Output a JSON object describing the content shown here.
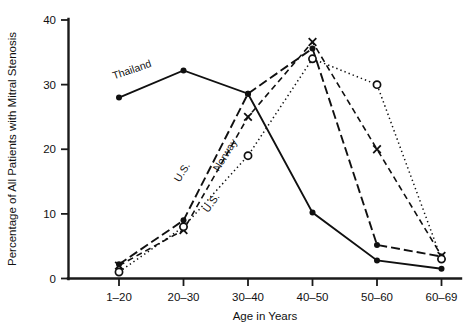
{
  "chart_data": {
    "type": "line",
    "title": "",
    "xlabel": "Age in Years",
    "ylabel": "Percentage of All Patients with Mitral Stenosis",
    "categories": [
      "1–20",
      "20–30",
      "30–40",
      "40–50",
      "50–60",
      "60–69"
    ],
    "ylim": [
      0,
      40
    ],
    "yticks": [
      0,
      10,
      20,
      30,
      40
    ],
    "ytick_labels": [
      "0",
      "10",
      "20",
      "30",
      "40"
    ],
    "grid": false,
    "legend": "inline-labels",
    "series": [
      {
        "name": "Thailand",
        "marker": "filled-circle",
        "line_style": "solid",
        "values": [
          28,
          32.2,
          28.6,
          10.2,
          2.8,
          1.5
        ],
        "label_text": "Thailand"
      },
      {
        "name": "U.S. (dash-dot)",
        "marker": "filled-circle",
        "line_style": "dash-dot",
        "values": [
          2.2,
          9,
          28.6,
          35.6,
          5.2,
          3.4
        ],
        "label_text": "U.S."
      },
      {
        "name": "Norway",
        "marker": "x",
        "line_style": "dashed",
        "values": [
          2,
          7.5,
          25,
          36.6,
          20,
          3.5
        ],
        "label_text": "Norway"
      },
      {
        "name": "U.S. (dotted)",
        "marker": "open-circle",
        "line_style": "dotted",
        "values": [
          1,
          8,
          19,
          34,
          30,
          3
        ],
        "label_text": "U.S."
      }
    ],
    "annotations": [
      {
        "text": "Thailand",
        "series": "Thailand"
      },
      {
        "text": "U.S.",
        "series": "U.S. (dash-dot)"
      },
      {
        "text": "Norway",
        "series": "Norway"
      },
      {
        "text": "U.S.",
        "series": "U.S. (dotted)"
      }
    ]
  }
}
